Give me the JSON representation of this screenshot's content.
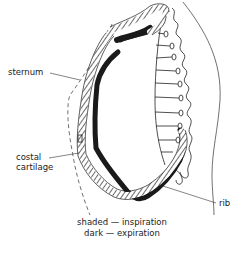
{
  "figure": {
    "labels": {
      "sternum": "sternum",
      "costal_cartilage_line1": "costal",
      "costal_cartilage_line2": "cartilage",
      "rib": "rib"
    },
    "legend": [
      {
        "key": "shaded",
        "text": "shaded — inspiration"
      },
      {
        "key": "dark",
        "text": "dark — expiration"
      }
    ],
    "colors": {
      "ink": "#1a1a1a",
      "background": "#ffffff"
    }
  }
}
